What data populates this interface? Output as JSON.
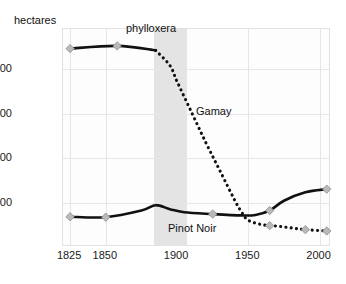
{
  "chart_data": {
    "type": "line",
    "title": "",
    "xlabel": "",
    "ylabel": "hectares",
    "xlim": [
      1820,
      2008
    ],
    "ylim": [
      0,
      24500
    ],
    "grid": true,
    "legend_position": "inline-annotations",
    "xticks": [
      "1825",
      "1850",
      "1900",
      "1950",
      "2000"
    ],
    "xtick_values": [
      1825,
      1850,
      1900,
      1950,
      2000
    ],
    "yticks": [
      "20,000",
      "15,000",
      "10,000",
      "5,000"
    ],
    "ytick_values": [
      20000,
      15000,
      10000,
      5000
    ],
    "series": [
      {
        "name": "Gamay",
        "style": "solid-then-dotted",
        "x": [
          1825,
          1858,
          1885,
          1895,
          1900,
          1910,
          1920,
          1930,
          1940,
          1945,
          1950,
          1960,
          1970,
          1980,
          1990,
          2005
        ],
        "values": [
          22300,
          22600,
          22100,
          20400,
          18600,
          15200,
          11800,
          8600,
          5400,
          4000,
          3000,
          2500,
          2350,
          2150,
          1950,
          1800
        ],
        "markers_x": [
          1825,
          1858,
          1965,
          1990,
          2005
        ],
        "markers_y": [
          22300,
          22600,
          2400,
          1950,
          1800
        ]
      },
      {
        "name": "Pinot Noir",
        "style": "solid",
        "x": [
          1825,
          1850,
          1875,
          1885,
          1895,
          1905,
          1925,
          1945,
          1955,
          1965,
          1975,
          1990,
          2005
        ],
        "values": [
          3400,
          3350,
          4100,
          4700,
          4250,
          3900,
          3700,
          3550,
          3600,
          4100,
          5200,
          6150,
          6500
        ],
        "markers_x": [
          1825,
          1850,
          1925,
          1965,
          2005
        ],
        "markers_y": [
          3400,
          3350,
          3700,
          4100,
          6500
        ]
      }
    ],
    "annotations": [
      {
        "text": "phylloxera",
        "x": 1893,
        "y": 24000,
        "kind": "band-label"
      },
      {
        "text": "Gamay",
        "x": 1933,
        "y": 14100,
        "kind": "series-label"
      },
      {
        "text": "Pinot Noir",
        "x": 1915,
        "y": 2650,
        "kind": "series-label"
      }
    ],
    "shaded_bands": [
      {
        "label": "phylloxera",
        "x_start": 1884,
        "x_end": 1907,
        "color": "#d9d9d9"
      }
    ],
    "colors": {
      "line": "#111111",
      "marker_fill": "#b9b9b9",
      "marker_stroke": "#8e8e8e",
      "grid": "#e6e6e6",
      "band": "#d9d9d9",
      "plot_background": "#fdfdfd",
      "page_background": "#ffffff"
    }
  }
}
